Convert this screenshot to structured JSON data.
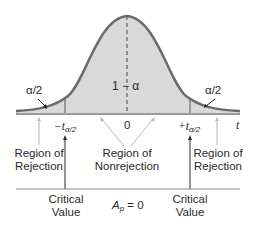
{
  "diagram": {
    "type": "two-tailed t-distribution rejection regions",
    "curve_labels": {
      "center_area": "1 − α",
      "left_tail_area": "α/2",
      "right_tail_area": "α/2"
    },
    "axis": {
      "variable": "t",
      "ticks": {
        "left_prefix": "−t",
        "left_sub": "α/2",
        "center": "0",
        "right_prefix": "+t",
        "right_sub": "α/2"
      }
    },
    "regions": {
      "left": [
        "Region of",
        "Rejection"
      ],
      "center": [
        "Region of",
        "Nonrejection"
      ],
      "right": [
        "Region of",
        "Rejection"
      ]
    },
    "bottom": {
      "left_critical": [
        "Critical",
        "Value"
      ],
      "center_label_main": "A",
      "center_label_sub": "p",
      "center_label_rest": " = 0",
      "right_critical": [
        "Critical",
        "Value"
      ]
    },
    "colors": {
      "curve": "#6b6b6b",
      "fill": "#d9d9d9",
      "axis": "#7a7a7a",
      "arrow_light": "#b8b8b8",
      "arrow_dark": "#2a2a2a"
    }
  }
}
